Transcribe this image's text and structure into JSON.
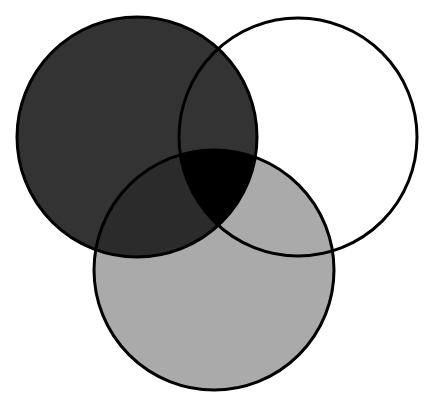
{
  "diagram": {
    "type": "venn",
    "set_count": 3,
    "canvas": {
      "width": 426,
      "height": 402,
      "background": "#ffffff"
    },
    "stroke": {
      "color": "#000000",
      "width": 3
    },
    "circles": [
      {
        "id": "top-left",
        "cx": 137,
        "cy": 137,
        "r": 120,
        "fill": "#333333"
      },
      {
        "id": "top-right",
        "cx": 298,
        "cy": 137,
        "r": 119,
        "fill": "#ffffff"
      },
      {
        "id": "bottom",
        "cx": 214,
        "cy": 270,
        "r": 120,
        "fill": "#aaaaaa"
      }
    ],
    "regions": {
      "top_left_and_bottom": "#2b2b2b",
      "top_left_and_top_right": "#333333",
      "top_right_and_bottom": "#aaaaaa",
      "all_three": "#000000"
    },
    "labels": []
  }
}
